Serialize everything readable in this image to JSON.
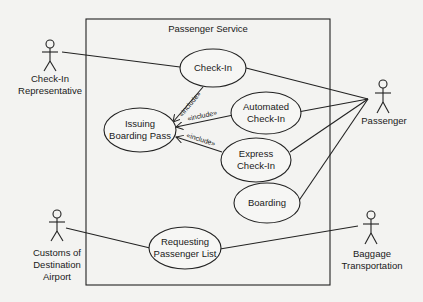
{
  "diagram": {
    "type": "uml-use-case",
    "system": {
      "name": "Passenger Service"
    },
    "actors": [
      {
        "id": "checkin_rep",
        "lines": [
          "Check-In",
          "Representative"
        ]
      },
      {
        "id": "passenger",
        "lines": [
          "Passenger"
        ]
      },
      {
        "id": "customs",
        "lines": [
          "Customs of",
          "Destination",
          "Airport"
        ]
      },
      {
        "id": "baggage",
        "lines": [
          "Baggage",
          "Transportation"
        ]
      }
    ],
    "use_cases": [
      {
        "id": "checkin",
        "lines": [
          "Check-In"
        ]
      },
      {
        "id": "automated",
        "lines": [
          "Automated",
          "Check-In"
        ]
      },
      {
        "id": "issuing",
        "lines": [
          "Issuing",
          "Boarding Pass"
        ]
      },
      {
        "id": "express",
        "lines": [
          "Express",
          "Check-In"
        ]
      },
      {
        "id": "boarding",
        "lines": [
          "Boarding"
        ]
      },
      {
        "id": "requesting",
        "lines": [
          "Requesting",
          "Passenger List"
        ]
      }
    ],
    "include_label": "«include»",
    "associations": [
      {
        "actor": "Check-In Representative",
        "use_case": "Check-In"
      },
      {
        "actor": "Passenger",
        "use_case": "Check-In"
      },
      {
        "actor": "Passenger",
        "use_case": "Automated Check-In"
      },
      {
        "actor": "Passenger",
        "use_case": "Express Check-In"
      },
      {
        "actor": "Passenger",
        "use_case": "Boarding"
      },
      {
        "actor": "Customs of Destination Airport",
        "use_case": "Requesting Passenger List"
      },
      {
        "actor": "Baggage Transportation",
        "use_case": "Requesting Passenger List"
      }
    ],
    "includes": [
      {
        "from": "Check-In",
        "to": "Issuing Boarding Pass"
      },
      {
        "from": "Automated Check-In",
        "to": "Issuing Boarding Pass"
      },
      {
        "from": "Express Check-In",
        "to": "Issuing Boarding Pass"
      }
    ]
  }
}
